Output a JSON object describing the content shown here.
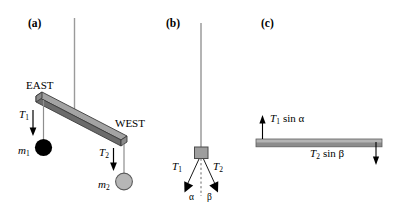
{
  "figure": {
    "background_color": "#ffffff",
    "width": 399,
    "height": 215
  },
  "panels": [
    {
      "id": "panel-a",
      "label": "(a)",
      "description": "Tilted beam suspended by a vertical string with two hanging masses",
      "labels": {
        "east": "EAST",
        "west": "WEST",
        "tension_1": "T",
        "tension_1_sub": "1",
        "tension_2": "T",
        "tension_2_sub": "2",
        "mass_1": "m",
        "mass_1_sub": "1",
        "mass_2": "m",
        "mass_2_sub": "2"
      },
      "colors": {
        "beam_top": "#a0a0a0",
        "beam_front": "#6e6e6e",
        "beam_edge": "#3b3b3b",
        "string": "#9a9a9a",
        "mass_1_fill": "#000000",
        "mass_2_fill": "#b3b3b3",
        "mass_2_stroke": "#555555",
        "arrow": "#000000"
      }
    },
    {
      "id": "panel-b",
      "label": "(b)",
      "description": "Block hanging from a vertical string with two tension forces at angles alpha and beta",
      "labels": {
        "tension_1": "T",
        "tension_1_sub": "1",
        "tension_2": "T",
        "tension_2_sub": "2",
        "angle_alpha": "α",
        "angle_beta": "β"
      },
      "colors": {
        "string": "#8c8c8c",
        "block_fill": "#9e9e9e",
        "block_stroke": "#4a4a4a",
        "dashed_line": "#666666",
        "arrow": "#000000"
      }
    },
    {
      "id": "panel-c",
      "label": "(c)",
      "description": "Horizontal beam with vertical force components at both ends",
      "labels": {
        "force_left": "T",
        "force_left_sub": "1",
        "force_left_rest": "sin α",
        "force_right": "T",
        "force_right_sub": "2",
        "force_right_rest": "sin β"
      },
      "colors": {
        "beam_top": "#b0b0b0",
        "beam_front": "#8a8a8a",
        "beam_edge": "#5a5a5a",
        "arrow": "#000000"
      }
    }
  ]
}
